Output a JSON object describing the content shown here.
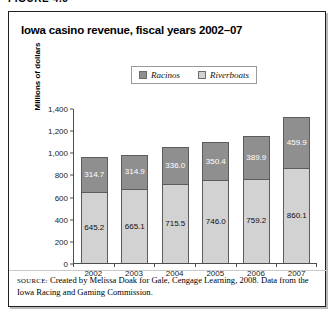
{
  "figure": {
    "label": "FIGURE 4.5"
  },
  "chart_data": {
    "type": "bar",
    "subtype": "stacked-column",
    "title": "Iowa casino revenue, fiscal years 2002–07",
    "xlabel": "",
    "ylabel": "Millions of dollars",
    "ylim": [
      0,
      1400
    ],
    "ytick_step": 200,
    "grid": false,
    "legend_position": "top-center",
    "categories": [
      "2002",
      "2003",
      "2004",
      "2005",
      "2006",
      "2007"
    ],
    "ytick_labels": [
      "0",
      "200",
      "400",
      "600",
      "800",
      "1,000",
      "1,200",
      "1,400"
    ],
    "ytick_values": [
      0,
      200,
      400,
      600,
      800,
      1000,
      1200,
      1400
    ],
    "series": [
      {
        "name": "Riverboats",
        "color": "#d2d2d2",
        "stack_position": "bottom",
        "values": [
          645.2,
          665.1,
          715.5,
          746.0,
          759.2,
          860.1
        ],
        "labels": [
          "645.2",
          "665.1",
          "715.5",
          "746.0",
          "759.2",
          "860.1"
        ]
      },
      {
        "name": "Racinos",
        "color": "#8f8f8f",
        "stack_position": "top",
        "values": [
          314.7,
          314.9,
          336.0,
          350.4,
          389.9,
          459.9
        ],
        "labels": [
          "314.7",
          "314.9",
          "336.0",
          "350.4",
          "389.9",
          "459.9"
        ]
      }
    ],
    "totals": [
      959.9,
      980.0,
      1051.5,
      1096.4,
      1149.1,
      1320.0
    ]
  },
  "legend": {
    "entries": [
      {
        "label": "Racinos",
        "color": "#8f8f8f"
      },
      {
        "label": "Riverboats",
        "color": "#d2d2d2"
      }
    ]
  },
  "source": {
    "prefix": "SOURCE:",
    "text": " Created by Melissa Doak for Gale, Cengage Learning, 2008. Data from the Iowa Racing and Gaming Commission."
  }
}
